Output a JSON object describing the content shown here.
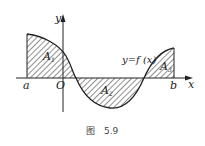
{
  "figure": {
    "caption_prefix": "图",
    "caption_number": "5.9",
    "axes": {
      "x_label": "x",
      "y_label": "y",
      "origin_label": "O"
    },
    "points": {
      "a_label": "a",
      "b_label": "b"
    },
    "curve_label": "y=f (x)",
    "regions": [
      {
        "name": "A",
        "sub": "1"
      },
      {
        "name": "A",
        "sub": "2"
      },
      {
        "name": "A",
        "sub": "3"
      }
    ],
    "colors": {
      "stroke": "#222222",
      "hatch": "#333333",
      "background": "#ffffff"
    }
  }
}
